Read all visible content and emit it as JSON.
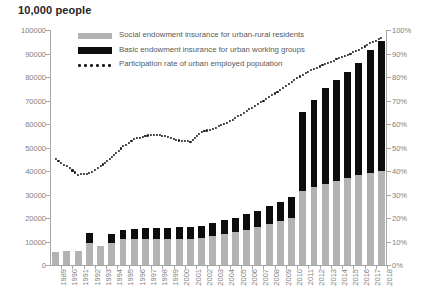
{
  "unit_title": "10,000 people",
  "legend": {
    "items": [
      {
        "key": "gray-swatch",
        "label": "Social endowment insurance for urban-rural residents"
      },
      {
        "key": "black-swatch",
        "label": "Basic endowment insurance for urban working groups"
      },
      {
        "key": "dotted-line",
        "label": "Participation rate of urban employed population"
      }
    ]
  },
  "axes": {
    "left_ticks": [
      "0",
      "10000",
      "20000",
      "30000",
      "40000",
      "50000",
      "60000",
      "70000",
      "80000",
      "90000",
      "100000"
    ],
    "right_ticks": [
      "0%",
      "10%",
      "20%",
      "30%",
      "40%",
      "50%",
      "60%",
      "70%",
      "80%",
      "90%",
      "100%"
    ]
  },
  "colors": {
    "residents_bar": "#b3b3b3",
    "working_bar": "#0d0d0d",
    "rate_line": "#1a1a1a",
    "axis": "#a6a6a6",
    "tick_text": "#808080"
  },
  "chart_data": {
    "type": "bar",
    "title": "10,000 people",
    "xlabel": "",
    "ylabel": "10,000 people",
    "y2label": "",
    "ylim": [
      0,
      100000
    ],
    "y2lim": [
      0,
      1.0
    ],
    "grid": false,
    "legend_position": "top-left-inside",
    "categories": [
      "1989",
      "1990",
      "1991",
      "1992",
      "1993",
      "1994",
      "1995",
      "1996",
      "1997",
      "1998",
      "1999",
      "2000",
      "2001",
      "2002",
      "2003",
      "2004",
      "2005",
      "2006",
      "2007",
      "2008",
      "2009",
      "2010",
      "2011",
      "2012",
      "2013",
      "2014",
      "2015",
      "2016",
      "2017",
      "2018"
    ],
    "series": [
      {
        "name": "Social endowment insurance for urban-rural residents",
        "type": "bar-stacked",
        "color": "#b3b3b3",
        "axis": "left",
        "values": [
          5710,
          5980,
          6160,
          9460,
          8010,
          9500,
          10980,
          11170,
          11200,
          11203,
          11090,
          11180,
          11270,
          11440,
          12250,
          13090,
          13960,
          15050,
          16180,
          17490,
          18940,
          19870,
          31700,
          33100,
          34500,
          35600,
          36900,
          38200,
          39000,
          40200
        ]
      },
      {
        "name": "Basic endowment insurance for urban working groups",
        "type": "bar-stacked",
        "color": "#0d0d0d",
        "axis": "left",
        "values": [
          0,
          0,
          0,
          4200,
          0,
          3900,
          3900,
          4200,
          4500,
          4600,
          4700,
          4800,
          5000,
          5200,
          5500,
          5900,
          6200,
          6600,
          7000,
          7500,
          8000,
          8900,
          33500,
          37000,
          40700,
          43100,
          45100,
          47700,
          52500,
          55200
        ]
      },
      {
        "name": "Participation rate of urban employed population",
        "type": "line-dotted",
        "color": "#1a1a1a",
        "axis": "right",
        "values": [
          0.45,
          0.42,
          0.385,
          0.39,
          0.42,
          0.46,
          0.505,
          0.535,
          0.55,
          0.555,
          0.545,
          0.53,
          0.525,
          0.565,
          0.58,
          0.6,
          0.625,
          0.655,
          0.685,
          0.715,
          0.745,
          0.78,
          0.81,
          0.835,
          0.855,
          0.875,
          0.895,
          0.915,
          0.945,
          0.965
        ]
      }
    ]
  }
}
